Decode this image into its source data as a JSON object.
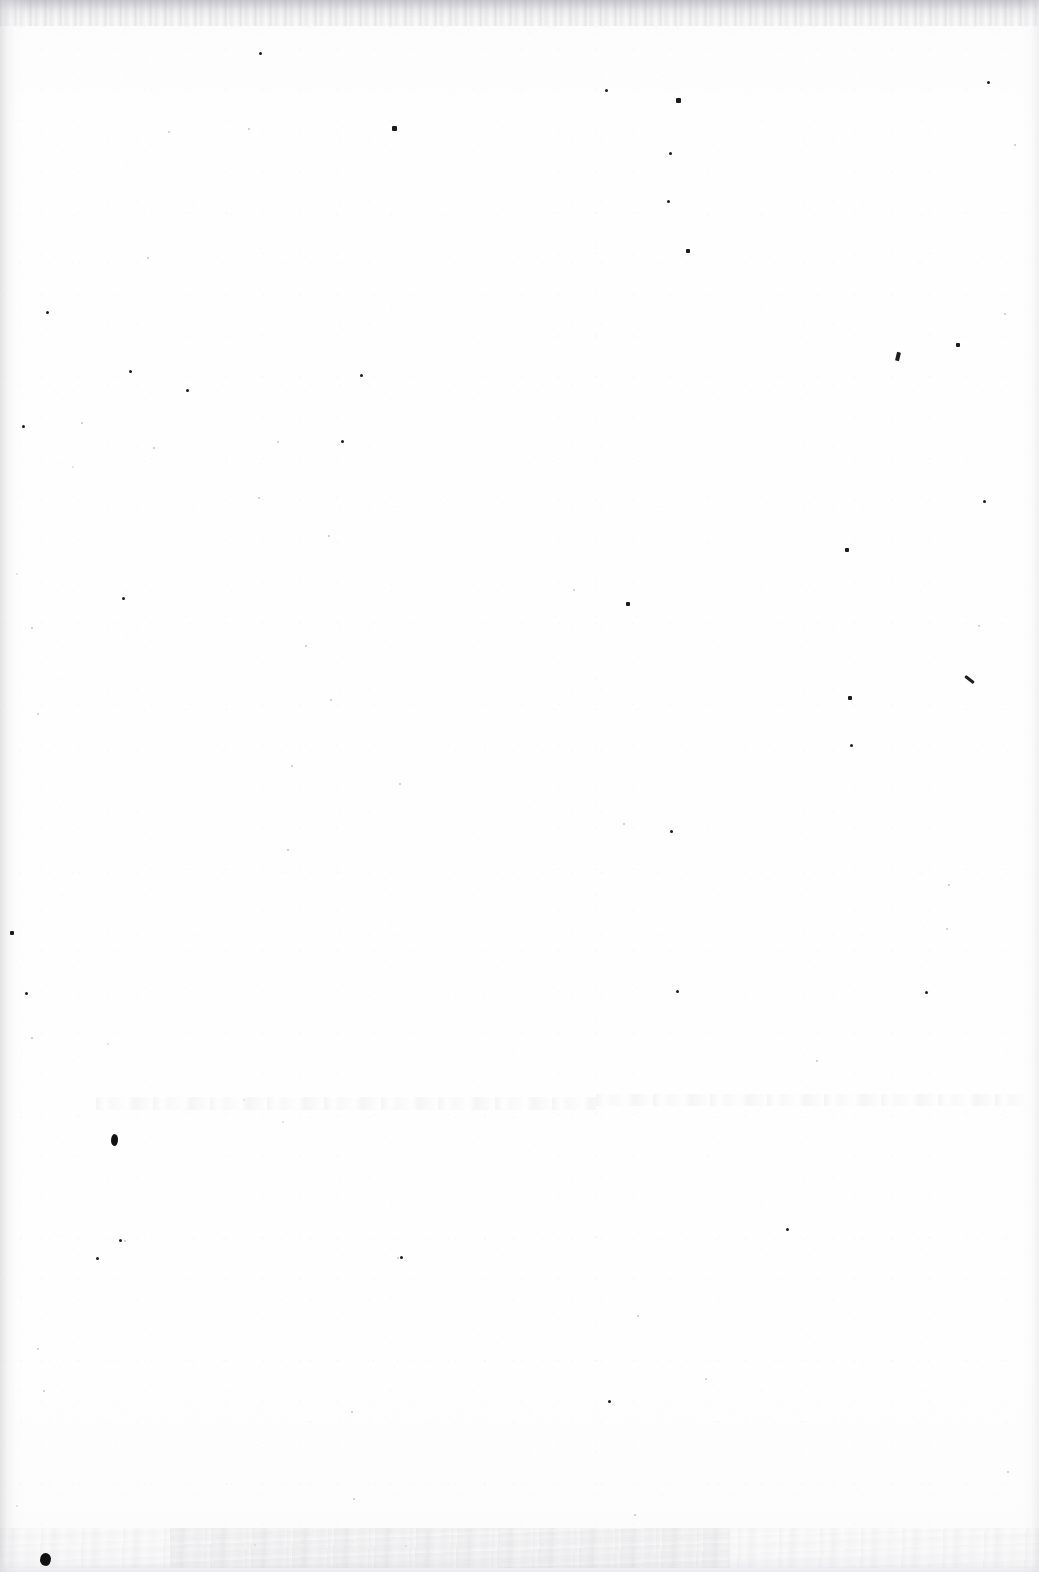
{
  "document": {
    "type": "scanned-page",
    "content_text": "",
    "page_width": 1039,
    "page_height": 1572,
    "background_color": "#fefefe",
    "ink_color": "#1b1b1b",
    "edge_shadow_color": "#cdcdd0",
    "description": "Blank scanned document page — no visible text, headings, figures or rules. Only paper grain, scattered dust specks and scanner edge shading are present."
  },
  "artifacts": {
    "edges": [
      {
        "name": "top-fringe",
        "side": "top",
        "thickness_px": 26
      },
      {
        "name": "left-shadow",
        "side": "left",
        "thickness_px": 26
      },
      {
        "name": "right-shadow",
        "side": "right",
        "thickness_px": 18
      },
      {
        "name": "bottom-shadow",
        "side": "bottom",
        "thickness_px": 16
      }
    ],
    "ghost_bands": [
      {
        "x": 96,
        "y": 1097,
        "width": 500,
        "height": 13
      },
      {
        "x": 596,
        "y": 1094,
        "width": 430,
        "height": 12
      }
    ],
    "stain_bands": [
      {
        "x": 0,
        "y": 1528,
        "width": 1039,
        "height": 40
      },
      {
        "x": 170,
        "y": 1528,
        "width": 560,
        "height": 40
      }
    ],
    "blobs": [
      {
        "x": 40,
        "y": 1553,
        "width": 11,
        "height": 13
      },
      {
        "x": 111,
        "y": 1134,
        "width": 7,
        "height": 12
      }
    ],
    "fibers": [
      {
        "x": 964,
        "y": 678,
        "width": 11,
        "height": 3,
        "rotate": 38
      },
      {
        "x": 896,
        "y": 352,
        "width": 4,
        "height": 9,
        "rotate": 14
      }
    ],
    "specks": [
      {
        "x": 259,
        "y": 52,
        "s": 3,
        "t": "dark"
      },
      {
        "x": 605,
        "y": 89,
        "s": 3,
        "t": "dark"
      },
      {
        "x": 676,
        "y": 98,
        "s": 5,
        "t": "dark"
      },
      {
        "x": 987,
        "y": 81,
        "s": 3,
        "t": "dark"
      },
      {
        "x": 392,
        "y": 126,
        "s": 5,
        "t": "dark"
      },
      {
        "x": 669,
        "y": 152,
        "s": 3,
        "t": "dark"
      },
      {
        "x": 168,
        "y": 131,
        "s": 2,
        "t": "soft"
      },
      {
        "x": 248,
        "y": 128,
        "s": 2,
        "t": "soft"
      },
      {
        "x": 667,
        "y": 200,
        "s": 3,
        "t": "dark"
      },
      {
        "x": 686,
        "y": 249,
        "s": 4,
        "t": "dark"
      },
      {
        "x": 147,
        "y": 257,
        "s": 2,
        "t": "soft"
      },
      {
        "x": 1014,
        "y": 144,
        "s": 2,
        "t": "soft"
      },
      {
        "x": 46,
        "y": 311,
        "s": 3,
        "t": "dark"
      },
      {
        "x": 1004,
        "y": 313,
        "s": 2,
        "t": "soft"
      },
      {
        "x": 956,
        "y": 343,
        "s": 4,
        "t": "dark"
      },
      {
        "x": 129,
        "y": 370,
        "s": 3,
        "t": "dark"
      },
      {
        "x": 360,
        "y": 374,
        "s": 3,
        "t": "dark"
      },
      {
        "x": 186,
        "y": 389,
        "s": 3,
        "t": "dark"
      },
      {
        "x": 22,
        "y": 425,
        "s": 3,
        "t": "dark"
      },
      {
        "x": 81,
        "y": 422,
        "s": 2,
        "t": "soft"
      },
      {
        "x": 153,
        "y": 447,
        "s": 2,
        "t": "soft"
      },
      {
        "x": 277,
        "y": 441,
        "s": 2,
        "t": "soft"
      },
      {
        "x": 341,
        "y": 440,
        "s": 3,
        "t": "dark"
      },
      {
        "x": 72,
        "y": 466,
        "s": 2,
        "t": "faint"
      },
      {
        "x": 983,
        "y": 500,
        "s": 3,
        "t": "dark"
      },
      {
        "x": 258,
        "y": 497,
        "s": 2,
        "t": "soft"
      },
      {
        "x": 328,
        "y": 535,
        "s": 2,
        "t": "soft"
      },
      {
        "x": 845,
        "y": 548,
        "s": 4,
        "t": "dark"
      },
      {
        "x": 16,
        "y": 573,
        "s": 2,
        "t": "faint"
      },
      {
        "x": 122,
        "y": 597,
        "s": 3,
        "t": "dark"
      },
      {
        "x": 573,
        "y": 589,
        "s": 2,
        "t": "soft"
      },
      {
        "x": 626,
        "y": 602,
        "s": 4,
        "t": "dark"
      },
      {
        "x": 31,
        "y": 627,
        "s": 2,
        "t": "soft"
      },
      {
        "x": 978,
        "y": 625,
        "s": 2,
        "t": "soft"
      },
      {
        "x": 305,
        "y": 645,
        "s": 2,
        "t": "soft"
      },
      {
        "x": 848,
        "y": 696,
        "s": 4,
        "t": "dark"
      },
      {
        "x": 37,
        "y": 713,
        "s": 2,
        "t": "soft"
      },
      {
        "x": 330,
        "y": 699,
        "s": 2,
        "t": "soft"
      },
      {
        "x": 850,
        "y": 744,
        "s": 3,
        "t": "dark"
      },
      {
        "x": 291,
        "y": 765,
        "s": 2,
        "t": "soft"
      },
      {
        "x": 399,
        "y": 783,
        "s": 2,
        "t": "soft"
      },
      {
        "x": 623,
        "y": 823,
        "s": 2,
        "t": "soft"
      },
      {
        "x": 670,
        "y": 830,
        "s": 3,
        "t": "dark"
      },
      {
        "x": 287,
        "y": 849,
        "s": 2,
        "t": "soft"
      },
      {
        "x": 948,
        "y": 884,
        "s": 2,
        "t": "soft"
      },
      {
        "x": 10,
        "y": 931,
        "s": 4,
        "t": "dark"
      },
      {
        "x": 946,
        "y": 928,
        "s": 2,
        "t": "soft"
      },
      {
        "x": 25,
        "y": 992,
        "s": 3,
        "t": "dark"
      },
      {
        "x": 676,
        "y": 990,
        "s": 3,
        "t": "dark"
      },
      {
        "x": 925,
        "y": 991,
        "s": 3,
        "t": "dark"
      },
      {
        "x": 31,
        "y": 1037,
        "s": 2,
        "t": "soft"
      },
      {
        "x": 107,
        "y": 1043,
        "s": 2,
        "t": "faint"
      },
      {
        "x": 816,
        "y": 1060,
        "s": 2,
        "t": "soft"
      },
      {
        "x": 243,
        "y": 1099,
        "s": 2,
        "t": "faint"
      },
      {
        "x": 282,
        "y": 1121,
        "s": 2,
        "t": "faint"
      },
      {
        "x": 786,
        "y": 1228,
        "s": 3,
        "t": "dark"
      },
      {
        "x": 119,
        "y": 1239,
        "s": 3,
        "t": "dark"
      },
      {
        "x": 96,
        "y": 1257,
        "s": 3,
        "t": "dark"
      },
      {
        "x": 400,
        "y": 1256,
        "s": 3,
        "t": "dark"
      },
      {
        "x": 637,
        "y": 1315,
        "s": 2,
        "t": "soft"
      },
      {
        "x": 705,
        "y": 1378,
        "s": 2,
        "t": "soft"
      },
      {
        "x": 37,
        "y": 1348,
        "s": 2,
        "t": "soft"
      },
      {
        "x": 43,
        "y": 1390,
        "s": 2,
        "t": "soft"
      },
      {
        "x": 351,
        "y": 1411,
        "s": 2,
        "t": "soft"
      },
      {
        "x": 608,
        "y": 1400,
        "s": 3,
        "t": "dark"
      },
      {
        "x": 353,
        "y": 1498,
        "s": 2,
        "t": "soft"
      },
      {
        "x": 634,
        "y": 1514,
        "s": 2,
        "t": "soft"
      },
      {
        "x": 1007,
        "y": 1471,
        "s": 2,
        "t": "soft"
      },
      {
        "x": 16,
        "y": 1505,
        "s": 2,
        "t": "faint"
      },
      {
        "x": 254,
        "y": 1544,
        "s": 2,
        "t": "faint"
      },
      {
        "x": 405,
        "y": 1545,
        "s": 2,
        "t": "faint"
      },
      {
        "x": 397,
        "y": 1257,
        "s": 2,
        "t": "soft"
      },
      {
        "x": 124,
        "y": 1240,
        "s": 2,
        "t": "soft"
      }
    ]
  }
}
